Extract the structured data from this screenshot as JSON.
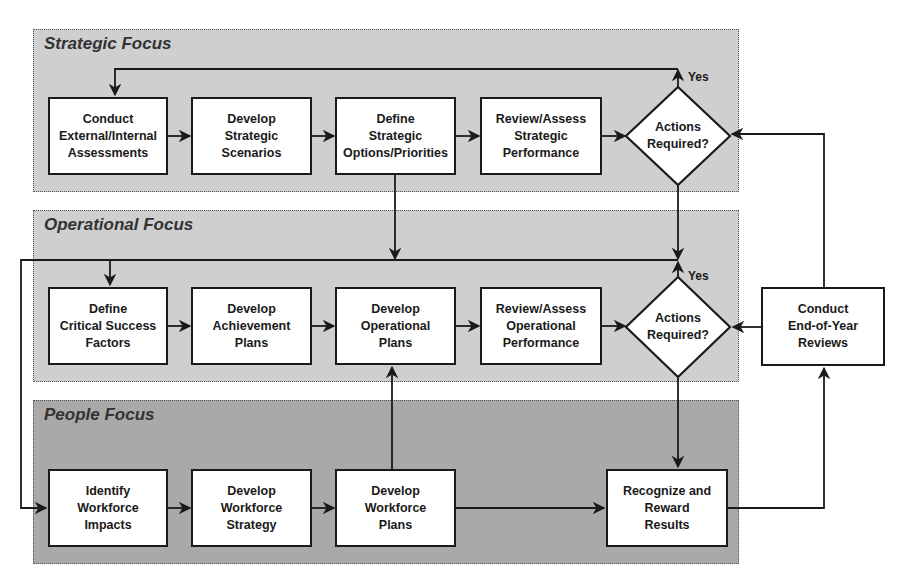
{
  "panels": {
    "strategic": {
      "title": "Strategic Focus"
    },
    "operational": {
      "title": "Operational Focus"
    },
    "people": {
      "title": "People Focus"
    }
  },
  "strategic": {
    "boxes": [
      {
        "label": "Conduct\nExternal/Internal\nAssessments"
      },
      {
        "label": "Develop\nStrategic\nScenarios"
      },
      {
        "label": "Define\nStrategic\nOptions/Priorities"
      },
      {
        "label": "Review/Assess\nStrategic\nPerformance"
      }
    ],
    "decision": {
      "label": "Actions\nRequired?",
      "yes_label": "Yes"
    }
  },
  "operational": {
    "boxes": [
      {
        "label": "Define\nCritical Success\nFactors"
      },
      {
        "label": "Develop\nAchievement\nPlans"
      },
      {
        "label": "Develop\nOperational\nPlans"
      },
      {
        "label": "Review/Assess\nOperational\nPerformance"
      }
    ],
    "decision": {
      "label": "Actions\nRequired?",
      "yes_label": "Yes"
    }
  },
  "people": {
    "boxes": [
      {
        "label": "Identify\nWorkforce\nImpacts"
      },
      {
        "label": "Develop\nWorkforce\nStrategy"
      },
      {
        "label": "Develop\nWorkforce\nPlans"
      },
      {
        "label": "Recognize and\nReward\nResults"
      }
    ]
  },
  "external": {
    "end_of_year": {
      "label": "Conduct\nEnd-of-Year\nReviews"
    }
  },
  "colors": {
    "panel_light": "#cfcfcf",
    "panel_dark": "#a9a9a9",
    "stroke": "#1a1a1a",
    "box_fill": "#ffffff"
  }
}
